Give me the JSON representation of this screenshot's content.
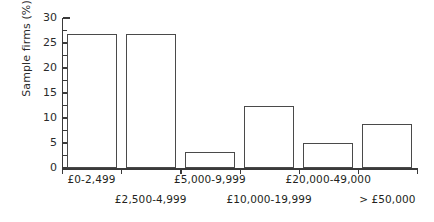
{
  "chart_data": {
    "type": "bar",
    "title": "",
    "xlabel": "",
    "ylabel": "Sample firms (%)",
    "ylim": [
      0,
      30
    ],
    "ytick_labels": [
      "0",
      "5",
      "10",
      "15",
      "20",
      "25",
      "30"
    ],
    "ytick_values": [
      0,
      5,
      10,
      15,
      20,
      25,
      30
    ],
    "minor_tick_step": 2.5,
    "grid": false,
    "legend": null,
    "bar_style": {
      "fill": "#ffffff",
      "edge": "#4a4a4a"
    },
    "categories": [
      "£0-2,499",
      "£2,500-4,999",
      "£5,000-9,999",
      "£10,000-19,999",
      "£20,000-49,000",
      "> £50,000"
    ],
    "values": [
      26.8,
      26.8,
      3.2,
      12.5,
      5.0,
      8.8
    ],
    "label_rows": [
      0,
      1,
      0,
      1,
      0,
      1
    ]
  }
}
